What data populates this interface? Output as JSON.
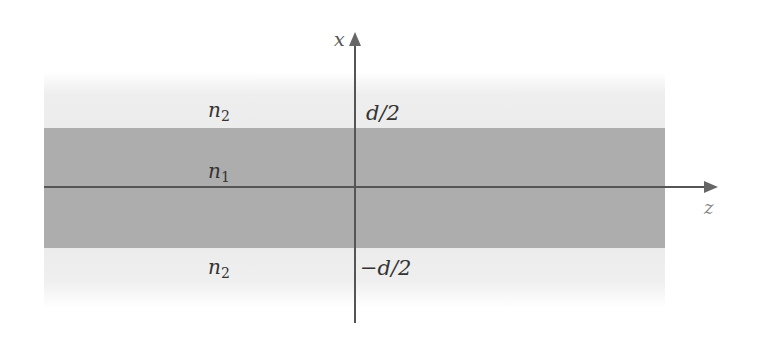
{
  "diagram": {
    "axes": {
      "vertical": {
        "label": "x"
      },
      "horizontal": {
        "label": "z"
      }
    },
    "regions": [
      {
        "name": "upper-cladding",
        "index_base": "n",
        "index_sub": "2",
        "color": "#eeeeee"
      },
      {
        "name": "core",
        "index_base": "n",
        "index_sub": "1",
        "color": "#adadad"
      },
      {
        "name": "lower-cladding",
        "index_base": "n",
        "index_sub": "2",
        "color": "#eeeeee"
      }
    ],
    "boundaries": {
      "upper": "d/2",
      "lower": "−d/2"
    }
  }
}
